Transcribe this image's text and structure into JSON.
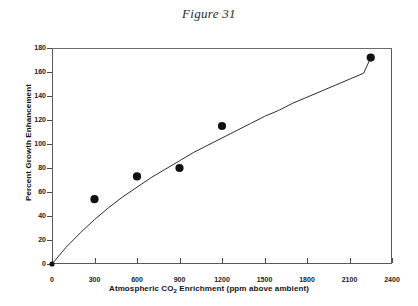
{
  "figure": {
    "caption": "Figure 31"
  },
  "chart_data": {
    "type": "scatter",
    "title": "Figure 31",
    "xlabel_prefix": "Atmospheric CO",
    "xlabel_sub": "2",
    "xlabel_suffix": " Enrichment (ppm above ambient)",
    "xlabel": "Atmospheric CO2 Enrichment (ppm above ambient)",
    "ylabel": "Percent Growth Enhancement",
    "xlim": [
      0,
      2400
    ],
    "ylim": [
      0,
      180
    ],
    "xticks": [
      0,
      300,
      600,
      900,
      1200,
      1500,
      1800,
      2100,
      2400
    ],
    "yticks": [
      0,
      20,
      40,
      60,
      80,
      100,
      120,
      140,
      160,
      180
    ],
    "grid": false,
    "legend": "none",
    "marker_color": "#111111",
    "line_color": "#2d2d2d",
    "series": [
      {
        "name": "Observed growth enhancement",
        "marker": "filled-circle",
        "x": [
          0,
          300,
          600,
          900,
          1200,
          2250
        ],
        "y": [
          0,
          54,
          73,
          80,
          115,
          172
        ]
      },
      {
        "name": "Fitted curve",
        "type": "line",
        "x": [
          0,
          100,
          200,
          300,
          400,
          500,
          600,
          700,
          800,
          900,
          1000,
          1100,
          1200,
          1300,
          1400,
          1500,
          1600,
          1700,
          1800,
          1900,
          2000,
          2100,
          2200,
          2250
        ],
        "y": [
          0,
          14,
          26,
          37,
          47,
          56,
          64,
          72,
          79,
          86,
          93,
          99,
          105,
          111,
          117,
          123,
          128,
          134,
          139,
          144,
          149,
          154,
          159,
          172
        ]
      }
    ]
  }
}
